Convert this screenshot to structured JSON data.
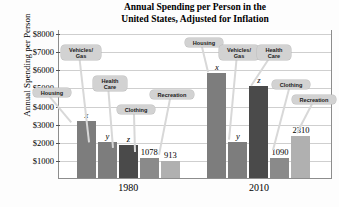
{
  "chart_data": {
    "type": "bar",
    "title": "Annual Spending per Person in the United States, Adjusted for Inflation",
    "title_line1": "Annual Spending per Person in the",
    "title_line2": "United States, Adjusted for Inflation",
    "xlabel": "",
    "ylabel": "Annual Spending per Person",
    "ylim": [
      0,
      8000
    ],
    "ytick_labels": [
      "$8000",
      "$7000",
      "$6000",
      "$5000",
      "$4000",
      "$3000",
      "$2000",
      "$1000"
    ],
    "ytick_values": [
      8000,
      7000,
      6000,
      5000,
      4000,
      3000,
      2000,
      1000
    ],
    "grid": true,
    "legend": "none",
    "categories": [
      "1980",
      "2010"
    ],
    "series": [
      {
        "name": "Housing",
        "values": [
          3150,
          5800
        ],
        "labels": [
          "x",
          "x"
        ],
        "color": "#7d7d7d"
      },
      {
        "name": "Vehicles/Gas",
        "values": [
          2000,
          2000
        ],
        "labels": [
          "y",
          "y"
        ],
        "color": "#7d7d7d"
      },
      {
        "name": "Health Care",
        "values": [
          1800,
          5100
        ],
        "labels": [
          "z",
          "z"
        ],
        "color": "#4a4a4a"
      },
      {
        "name": "Clothing",
        "values": [
          1078,
          1090
        ],
        "labels": [
          "1078",
          "1090"
        ],
        "color": "#8a8a8a"
      },
      {
        "name": "Recreation",
        "values": [
          913,
          2310
        ],
        "labels": [
          "913",
          "2310"
        ],
        "color": "#b0b0b0"
      }
    ],
    "callouts_1980": [
      {
        "label": "Vehicles/",
        "label2": "Gas"
      },
      {
        "label": "Housing",
        "label2": ""
      },
      {
        "label": "Health",
        "label2": "Care"
      },
      {
        "label": "Clothing",
        "label2": ""
      },
      {
        "label": "Recreation",
        "label2": ""
      }
    ],
    "callouts_2010": [
      {
        "label": "Housing",
        "label2": ""
      },
      {
        "label": "Vehicles/",
        "label2": "Gas"
      },
      {
        "label": "Health",
        "label2": "Care"
      },
      {
        "label": "Clothing",
        "label2": ""
      },
      {
        "label": "Recreation",
        "label2": ""
      }
    ]
  }
}
